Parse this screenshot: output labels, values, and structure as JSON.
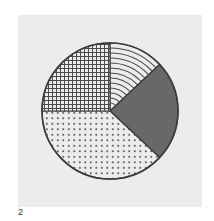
{
  "figure": {
    "label": "2"
  },
  "colors": {
    "background": "#ffffff",
    "panel": "#ececec",
    "outline": "#3a3a3a",
    "dark_fill": "#6b6b6b",
    "pattern_ink": "#4a4a4a"
  },
  "chart_data": {
    "type": "pie",
    "title": "",
    "start_angle_deg": 0,
    "direction": "clockwise",
    "labels": [
      "Concentric arcs",
      "Dark solid",
      "Dots",
      "Grid"
    ],
    "values": [
      13,
      24,
      38,
      25
    ],
    "patterns": [
      "arcs",
      "solid-dark",
      "dots",
      "grid"
    ],
    "legend": "none",
    "annotations": [
      "2"
    ]
  }
}
